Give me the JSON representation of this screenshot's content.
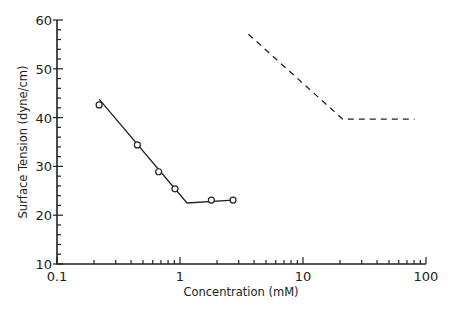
{
  "chart_data": {
    "type": "line",
    "title": "",
    "xlabel": "Concentration (mM)",
    "ylabel": "Surface Tension (dyne/cm)",
    "xscale": "log",
    "xlim": [
      0.1,
      100
    ],
    "ylim": [
      10,
      60
    ],
    "x_tick_labels": [
      "0.1",
      "1",
      "10",
      "100"
    ],
    "y_tick_labels": [
      "10",
      "20",
      "30",
      "40",
      "50",
      "60"
    ],
    "grid": false,
    "legend": null,
    "series": [
      {
        "name": "measured",
        "style": "markers (open circles)",
        "x": [
          0.22,
          0.45,
          0.67,
          0.91,
          1.8,
          2.7
        ],
        "y": [
          42.6,
          34.4,
          28.9,
          25.4,
          23.1,
          23.1
        ]
      },
      {
        "name": "fit",
        "style": "solid line",
        "x": [
          0.22,
          1.14,
          2.7
        ],
        "y": [
          43.8,
          22.5,
          23.1
        ]
      },
      {
        "name": "reference",
        "style": "dashed line",
        "x": [
          3.6,
          21,
          81
        ],
        "y": [
          57.1,
          39.7,
          39.7
        ]
      }
    ]
  }
}
